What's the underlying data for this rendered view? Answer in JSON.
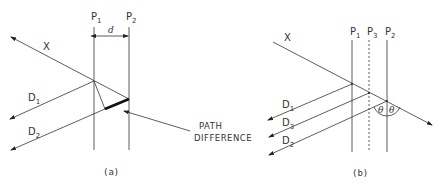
{
  "panel_a": {
    "caption": "(a)",
    "plane1": {
      "label": "P",
      "sub": "1"
    },
    "plane2": {
      "label": "P",
      "sub": "2"
    },
    "spacing_label": "d",
    "incident_ray": "X",
    "diffracted1": {
      "label": "D",
      "sub": "1"
    },
    "diffracted2": {
      "label": "D",
      "sub": "2"
    },
    "annotation_line1": "PATH",
    "annotation_line2": "DIFFERENCE"
  },
  "panel_b": {
    "caption": "(b)",
    "incident_ray": "X",
    "plane1": {
      "label": "P",
      "sub": "1"
    },
    "plane3": {
      "label": "P",
      "sub": "3"
    },
    "plane2": {
      "label": "P",
      "sub": "2"
    },
    "diffracted1": {
      "label": "D",
      "sub": "1"
    },
    "diffracted3": {
      "label": "D",
      "sub": "3"
    },
    "diffracted2": {
      "label": "D",
      "sub": "2"
    },
    "angle_left": "θ",
    "angle_right": "θ"
  }
}
